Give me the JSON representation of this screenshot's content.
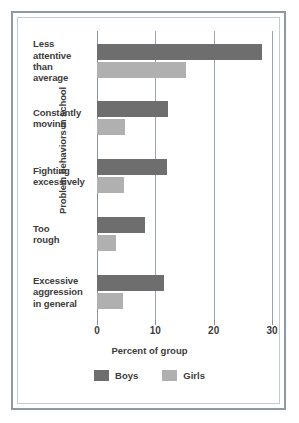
{
  "chart_data": {
    "type": "bar",
    "orientation": "horizontal",
    "title": "",
    "xlabel": "Percent of group",
    "ylabel": "Problem behaviors in school",
    "xlim": [
      0,
      30
    ],
    "xticks": [
      0,
      10,
      20,
      30
    ],
    "xtick_labels": [
      "0",
      "10",
      "20",
      "30"
    ],
    "grid": true,
    "grid_axis": "x",
    "legend_position": "bottom",
    "categories": [
      "Less attentive than average",
      "Constantly moving",
      "Fighting excessively",
      "Too rough",
      "Excessive aggression in general"
    ],
    "category_lines": [
      [
        "Less",
        "attentive",
        "than",
        "average"
      ],
      [
        "Constantly",
        "moving"
      ],
      [
        "Fighting",
        "excessively"
      ],
      [
        "Too",
        "rough"
      ],
      [
        "Excessive",
        "aggression",
        "in general"
      ]
    ],
    "series": [
      {
        "name": "Boys",
        "color": "#6e6e6e",
        "values": [
          28.3,
          12.2,
          12.0,
          8.2,
          11.4
        ]
      },
      {
        "name": "Girls",
        "color": "#b0b0b0",
        "values": [
          15.3,
          4.8,
          4.7,
          3.3,
          4.4
        ]
      }
    ]
  },
  "legend": {
    "items": [
      {
        "label": "Boys",
        "color": "#6e6e6e"
      },
      {
        "label": "Girls",
        "color": "#b0b0b0"
      }
    ]
  },
  "colors": {
    "boys": "#6e6e6e",
    "girls": "#b0b0b0",
    "frame": "#8d9aa6",
    "text": "#3c3c3c",
    "grid": "#9aa4ae",
    "background": "#ffffff"
  }
}
